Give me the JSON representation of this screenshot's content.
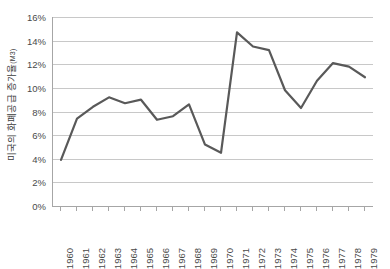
{
  "chart_data": {
    "type": "line",
    "title": "",
    "xlabel": "",
    "ylabel": "미국의 화폐공급 증가율(M3)",
    "ylabel_main": "미국의 화폐공급 증가율",
    "ylabel_sub": "(M3)",
    "x": [
      1960,
      1961,
      1962,
      1963,
      1964,
      1965,
      1966,
      1967,
      1968,
      1969,
      1970,
      1971,
      1972,
      1973,
      1974,
      1975,
      1976,
      1977,
      1978,
      1979
    ],
    "categories": [
      "1960",
      "1961",
      "1962",
      "1963",
      "1964",
      "1965",
      "1966",
      "1967",
      "1968",
      "1969",
      "1970",
      "1971",
      "1972",
      "1973",
      "1974",
      "1975",
      "1976",
      "1977",
      "1978",
      "1979"
    ],
    "values": [
      3.9,
      7.4,
      8.4,
      9.2,
      8.7,
      9.0,
      7.3,
      7.6,
      8.6,
      5.2,
      4.5,
      14.7,
      13.5,
      13.2,
      9.8,
      8.3,
      10.6,
      12.1,
      11.8,
      10.9
    ],
    "series": [
      {
        "name": "미국의 화폐공급 증가율(M3)",
        "values": [
          3.9,
          7.4,
          8.4,
          9.2,
          8.7,
          9.0,
          7.3,
          7.6,
          8.6,
          5.2,
          4.5,
          14.7,
          13.5,
          13.2,
          9.8,
          8.3,
          10.6,
          12.1,
          11.8,
          10.9
        ],
        "color": "#595959"
      }
    ],
    "ylim": [
      0,
      16
    ],
    "ytick_values": [
      0,
      2,
      4,
      6,
      8,
      10,
      12,
      14,
      16
    ],
    "ytick_labels": [
      "0%",
      "2%",
      "4%",
      "6%",
      "8%",
      "10%",
      "12%",
      "14%",
      "16%"
    ],
    "grid": true,
    "grid_axis": "y",
    "legend": false,
    "legend_position": "none",
    "line_color": "#595959",
    "grid_color": "#c8c8c8",
    "axis_color": "#a6a6a6",
    "background_color": "#ffffff"
  }
}
